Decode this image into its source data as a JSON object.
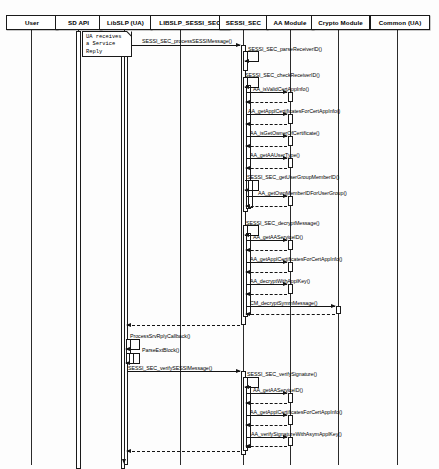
{
  "diagram": {
    "type": "uml-sequence-diagram",
    "width": 439,
    "height": 469,
    "line_color": "#141414",
    "box_fill": "#ffffff"
  },
  "participants": [
    {
      "id": "user",
      "label": "User",
      "x": 31,
      "box_x": 6,
      "box_w": 52
    },
    {
      "id": "sdapi",
      "label": "SD API",
      "x": 78,
      "box_x": 55,
      "box_w": 47
    },
    {
      "id": "libslp",
      "label": "LibSLP (UA)",
      "x": 124,
      "box_x": 99,
      "box_w": 53
    },
    {
      "id": "libsec",
      "label": "LIBSLP_SESSI_SEC",
      "x": 180,
      "box_x": 150,
      "box_w": 80
    },
    {
      "id": "sessi",
      "label": "SESSI_SEC",
      "x": 243,
      "box_x": 219,
      "box_w": 49
    },
    {
      "id": "aa",
      "label": "AA Module",
      "x": 290,
      "box_x": 266,
      "box_w": 48
    },
    {
      "id": "crypto",
      "label": "Crypto Module",
      "x": 338,
      "box_x": 311,
      "box_w": 59
    },
    {
      "id": "common",
      "label": "Common (UA)",
      "x": 397,
      "box_x": 370,
      "box_w": 60
    }
  ],
  "note": {
    "text": "UA receives\na Service\nReply",
    "x": 82,
    "y": 31,
    "w": 50,
    "h": 26
  },
  "messages": [
    {
      "seq": 1,
      "label": "SESSI_SEC_processSESSIMessage()",
      "from": "libslp",
      "to": "sessi",
      "y": 45,
      "kind": "call",
      "label_x": 142,
      "label_y": 38
    },
    {
      "seq": 2,
      "label": "SESSI_SEC_parseReceiverID()",
      "from": "sessi",
      "to": "sessi",
      "y": 51,
      "kind": "self",
      "label_x": 248,
      "label_y": 46
    },
    {
      "seq": 3,
      "label": "SESSI_SEC_checkReceiverID()",
      "from": "sessi",
      "to": "sessi",
      "y": 77,
      "kind": "self",
      "label_x": 245,
      "label_y": 72
    },
    {
      "seq": 4,
      "label": "AA_isValidCertAppInfo()",
      "from": "sessi",
      "to": "aa",
      "y": 92,
      "kind": "call",
      "label_x": 253,
      "label_y": 86
    },
    {
      "seq": 5,
      "label": "",
      "from": "aa",
      "to": "sessi",
      "y": 102,
      "kind": "return",
      "label_x": 0,
      "label_y": 0
    },
    {
      "seq": 6,
      "label": "AA_getApplCertificatesForCertAppInfo()",
      "from": "sessi",
      "to": "aa",
      "y": 114,
      "kind": "call",
      "label_x": 248,
      "label_y": 108
    },
    {
      "seq": 7,
      "label": "",
      "from": "aa",
      "to": "sessi",
      "y": 124,
      "kind": "return",
      "label_x": 0,
      "label_y": 0
    },
    {
      "seq": 8,
      "label": "AA_isGetOwnerOfCertificate()",
      "from": "sessi",
      "to": "aa",
      "y": 136,
      "kind": "call",
      "label_x": 250,
      "label_y": 130
    },
    {
      "seq": 9,
      "label": "",
      "from": "aa",
      "to": "sessi",
      "y": 146,
      "kind": "return",
      "label_x": 0,
      "label_y": 0
    },
    {
      "seq": 10,
      "label": "AA_getAAUserType()",
      "from": "sessi",
      "to": "aa",
      "y": 158,
      "kind": "call",
      "label_x": 250,
      "label_y": 152
    },
    {
      "seq": 11,
      "label": "",
      "from": "aa",
      "to": "sessi",
      "y": 168,
      "kind": "return",
      "label_x": 0,
      "label_y": 0
    },
    {
      "seq": 12,
      "label": "SESSI_SEC_getUserGroupMemberID()",
      "from": "sessi",
      "to": "sessi",
      "y": 180,
      "kind": "self",
      "label_x": 247,
      "label_y": 174
    },
    {
      "seq": 13,
      "label": "AA_getOwnMemberIDForUserGroup()",
      "from": "sessi",
      "to": "aa",
      "y": 196,
      "kind": "call",
      "label_x": 258,
      "label_y": 190
    },
    {
      "seq": 14,
      "label": "",
      "from": "aa",
      "to": "sessi",
      "y": 206,
      "kind": "return",
      "label_x": 0,
      "label_y": 0
    },
    {
      "seq": 15,
      "label": "SESSI_SEC_decryptMessage()",
      "from": "sessi",
      "to": "sessi",
      "y": 225,
      "kind": "self",
      "label_x": 246,
      "label_y": 220
    },
    {
      "seq": 16,
      "label": "AA_getAAServiceID()",
      "from": "sessi",
      "to": "aa",
      "y": 240,
      "kind": "call",
      "label_x": 253,
      "label_y": 234
    },
    {
      "seq": 17,
      "label": "",
      "from": "aa",
      "to": "sessi",
      "y": 250,
      "kind": "return",
      "label_x": 0,
      "label_y": 0
    },
    {
      "seq": 18,
      "label": "AA_getApplCertificatesForCertAppInfo()",
      "from": "sessi",
      "to": "aa",
      "y": 262,
      "kind": "call",
      "label_x": 250,
      "label_y": 256
    },
    {
      "seq": 19,
      "label": "",
      "from": "aa",
      "to": "sessi",
      "y": 272,
      "kind": "return",
      "label_x": 0,
      "label_y": 0
    },
    {
      "seq": 20,
      "label": "AA_decryptWithApplKey()",
      "from": "sessi",
      "to": "aa",
      "y": 284,
      "kind": "call",
      "label_x": 250,
      "label_y": 278
    },
    {
      "seq": 21,
      "label": "",
      "from": "aa",
      "to": "sessi",
      "y": 294,
      "kind": "return",
      "label_x": 0,
      "label_y": 0
    },
    {
      "seq": 22,
      "label": "CM_decryptSymmMessage()",
      "from": "sessi",
      "to": "crypto",
      "y": 306,
      "kind": "call",
      "label_x": 250,
      "label_y": 300
    },
    {
      "seq": 23,
      "label": "",
      "from": "crypto",
      "to": "sessi",
      "y": 314,
      "kind": "return",
      "label_x": 0,
      "label_y": 0
    },
    {
      "seq": 24,
      "label": "",
      "from": "sessi",
      "to": "libslp",
      "y": 325,
      "kind": "return",
      "label_x": 0,
      "label_y": 0
    },
    {
      "seq": 25,
      "label": "ProcessSrvRplyCallback()",
      "from": "libslp",
      "to": "libslp",
      "y": 339,
      "kind": "self",
      "label_x": 130,
      "label_y": 333
    },
    {
      "seq": 26,
      "label": "ParseExtBlock()",
      "from": "libslp",
      "to": "libslp",
      "y": 353,
      "kind": "self",
      "label_x": 142,
      "label_y": 347
    },
    {
      "seq": 27,
      "label": "SESSI_SEC_verifySESSIMessage()",
      "from": "libslp",
      "to": "sessi",
      "y": 371,
      "kind": "call",
      "label_x": 128,
      "label_y": 365
    },
    {
      "seq": 28,
      "label": "SESSI_SEC_verifySignature()",
      "from": "sessi",
      "to": "sessi",
      "y": 377,
      "kind": "self",
      "label_x": 247,
      "label_y": 371
    },
    {
      "seq": 29,
      "label": "AA_getAAServiceID()",
      "from": "sessi",
      "to": "aa",
      "y": 393,
      "kind": "call",
      "label_x": 253,
      "label_y": 387
    },
    {
      "seq": 30,
      "label": "",
      "from": "aa",
      "to": "sessi",
      "y": 403,
      "kind": "return",
      "label_x": 0,
      "label_y": 0
    },
    {
      "seq": 31,
      "label": "AA_getApplCertificatesForCertAppInfo()",
      "from": "sessi",
      "to": "aa",
      "y": 415,
      "kind": "call",
      "label_x": 250,
      "label_y": 409
    },
    {
      "seq": 32,
      "label": "",
      "from": "aa",
      "to": "sessi",
      "y": 425,
      "kind": "return",
      "label_x": 0,
      "label_y": 0
    },
    {
      "seq": 33,
      "label": "AA_verifySignatureWithAsymApplKey()",
      "from": "sessi",
      "to": "aa",
      "y": 437,
      "kind": "call",
      "label_x": 251,
      "label_y": 431
    },
    {
      "seq": 34,
      "label": "",
      "from": "aa",
      "to": "sessi",
      "y": 446,
      "kind": "return",
      "label_x": 0,
      "label_y": 0
    },
    {
      "seq": 35,
      "label": "",
      "from": "sessi",
      "to": "libslp",
      "y": 451,
      "kind": "return",
      "label_x": 0,
      "label_y": 0
    }
  ],
  "activations": [
    {
      "id": "a-sdapi-1",
      "on": "sdapi",
      "x": 75.5,
      "y": 31,
      "w": 5,
      "h": 438
    },
    {
      "id": "a-libslp-1",
      "on": "libslp",
      "x": 120.5,
      "y": 31,
      "w": 4,
      "h": 438
    },
    {
      "id": "a-libslp-2",
      "on": "libslp",
      "x": 123.5,
      "y": 40,
      "w": 4,
      "h": 425
    },
    {
      "id": "a-libslp-3",
      "on": "libslp",
      "x": 126,
      "y": 339,
      "w": 5,
      "h": 25
    },
    {
      "id": "a-libslp-4",
      "on": "libslp",
      "x": 128.5,
      "y": 353,
      "w": 5,
      "h": 11
    },
    {
      "id": "a-sessi-1",
      "on": "sessi",
      "x": 240.5,
      "y": 45,
      "w": 5,
      "h": 280
    },
    {
      "id": "a-sessi-2",
      "on": "sessi",
      "x": 243,
      "y": 51,
      "w": 5,
      "h": 20
    },
    {
      "id": "a-sessi-3",
      "on": "sessi",
      "x": 243,
      "y": 77,
      "w": 5,
      "h": 135
    },
    {
      "id": "a-sessi-4",
      "on": "sessi",
      "x": 245.5,
      "y": 85,
      "w": 5,
      "h": 124
    },
    {
      "id": "a-sessi-5",
      "on": "sessi",
      "x": 248,
      "y": 180,
      "w": 5,
      "h": 28
    },
    {
      "id": "a-sessi-6",
      "on": "sessi",
      "x": 243,
      "y": 225,
      "w": 5,
      "h": 92
    },
    {
      "id": "a-sessi-7",
      "on": "sessi",
      "x": 245.5,
      "y": 233,
      "w": 5,
      "h": 82
    },
    {
      "id": "a-sessi-8",
      "on": "sessi",
      "x": 240.5,
      "y": 371,
      "w": 5,
      "h": 84
    },
    {
      "id": "a-sessi-9",
      "on": "sessi",
      "x": 243,
      "y": 377,
      "w": 5,
      "h": 74
    },
    {
      "id": "a-sessi-10",
      "on": "sessi",
      "x": 245.5,
      "y": 386,
      "w": 5,
      "h": 62
    },
    {
      "id": "a-aa-1",
      "on": "aa",
      "x": 287.5,
      "y": 92,
      "w": 5,
      "h": 10
    },
    {
      "id": "a-aa-2",
      "on": "aa",
      "x": 287.5,
      "y": 114,
      "w": 5,
      "h": 10
    },
    {
      "id": "a-aa-3",
      "on": "aa",
      "x": 287.5,
      "y": 136,
      "w": 5,
      "h": 10
    },
    {
      "id": "a-aa-4",
      "on": "aa",
      "x": 287.5,
      "y": 158,
      "w": 5,
      "h": 10
    },
    {
      "id": "a-aa-5",
      "on": "aa",
      "x": 287.5,
      "y": 196,
      "w": 5,
      "h": 10
    },
    {
      "id": "a-aa-6",
      "on": "aa",
      "x": 287.5,
      "y": 240,
      "w": 5,
      "h": 10
    },
    {
      "id": "a-aa-7",
      "on": "aa",
      "x": 287.5,
      "y": 262,
      "w": 5,
      "h": 10
    },
    {
      "id": "a-aa-8",
      "on": "aa",
      "x": 287.5,
      "y": 284,
      "w": 5,
      "h": 10
    },
    {
      "id": "a-aa-9",
      "on": "aa",
      "x": 287.5,
      "y": 393,
      "w": 5,
      "h": 10
    },
    {
      "id": "a-aa-10",
      "on": "aa",
      "x": 287.5,
      "y": 415,
      "w": 5,
      "h": 10
    },
    {
      "id": "a-aa-11",
      "on": "aa",
      "x": 287.5,
      "y": 437,
      "w": 5,
      "h": 9
    },
    {
      "id": "a-crypto-1",
      "on": "crypto",
      "x": 335.5,
      "y": 306,
      "w": 5,
      "h": 8
    }
  ],
  "terminal_arrow": {
    "x": 124,
    "y": 451,
    "h": 12
  }
}
